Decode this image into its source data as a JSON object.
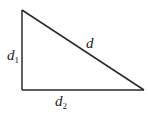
{
  "diagram": {
    "type": "right-triangle",
    "vertices": {
      "top": [
        22,
        10
      ],
      "right_angle": [
        22,
        90
      ],
      "right": [
        144,
        90
      ]
    },
    "stroke_color": "#2a2a2a",
    "labels": {
      "vertical_side": {
        "base": "d",
        "subscript": "1"
      },
      "horizontal_side": {
        "base": "d",
        "subscript": "2"
      },
      "hypotenuse": {
        "base": "d"
      }
    }
  }
}
